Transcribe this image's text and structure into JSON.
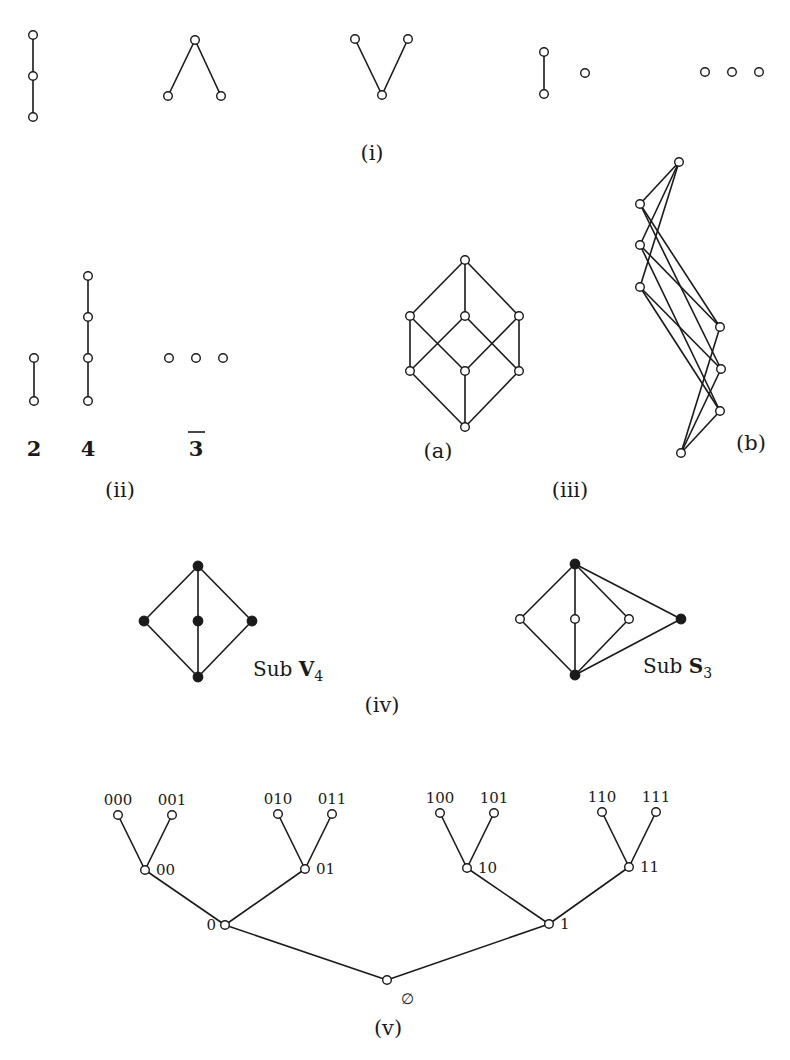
{
  "figure": {
    "panels": {
      "i": {
        "caption": "(i)",
        "posets": [
          {
            "name": "chain-3",
            "nodes": [
              [
                33,
                35
              ],
              [
                33,
                76
              ],
              [
                33,
                117
              ]
            ],
            "edges": [
              [
                0,
                1
              ],
              [
                1,
                2
              ]
            ]
          },
          {
            "name": "lambda",
            "nodes": [
              [
                195,
                40
              ],
              [
                168,
                96
              ],
              [
                221,
                96
              ]
            ],
            "edges": [
              [
                0,
                1
              ],
              [
                0,
                2
              ]
            ]
          },
          {
            "name": "vee",
            "nodes": [
              [
                355,
                39
              ],
              [
                408,
                39
              ],
              [
                382,
                95
              ]
            ],
            "edges": [
              [
                0,
                2
              ],
              [
                1,
                2
              ]
            ]
          },
          {
            "name": "chain-2-plus-point",
            "nodes": [
              [
                544,
                52
              ],
              [
                544,
                94
              ],
              [
                585,
                73
              ]
            ],
            "edges": [
              [
                0,
                1
              ]
            ]
          },
          {
            "name": "antichain-3",
            "nodes": [
              [
                705,
                72
              ],
              [
                732,
                72
              ],
              [
                759,
                72
              ]
            ],
            "edges": []
          }
        ]
      },
      "ii": {
        "caption": "(ii)",
        "posets": [
          {
            "name": "chain-2",
            "label": "2",
            "nodes": [
              [
                34,
                358
              ],
              [
                34,
                401
              ]
            ],
            "edges": [
              [
                0,
                1
              ]
            ]
          },
          {
            "name": "chain-4",
            "label": "4",
            "nodes": [
              [
                88,
                276
              ],
              [
                88,
                317
              ],
              [
                88,
                358
              ],
              [
                88,
                401
              ]
            ],
            "edges": [
              [
                0,
                1
              ],
              [
                1,
                2
              ],
              [
                2,
                3
              ]
            ]
          },
          {
            "name": "antichain-3",
            "label": "3",
            "label_overline": true,
            "nodes": [
              [
                169,
                358
              ],
              [
                196,
                358
              ],
              [
                223,
                358
              ]
            ],
            "edges": []
          }
        ]
      },
      "iii": {
        "caption": "(iii)",
        "sub_captions": [
          "(a)",
          "(b)"
        ],
        "posets": [
          {
            "name": "cube-a",
            "nodes": [
              [
                465,
                260
              ],
              [
                410,
                316
              ],
              [
                465,
                316
              ],
              [
                519,
                316
              ],
              [
                410,
                371
              ],
              [
                465,
                371
              ],
              [
                519,
                371
              ],
              [
                465,
                427
              ]
            ],
            "edges": [
              [
                0,
                1
              ],
              [
                0,
                2
              ],
              [
                0,
                3
              ],
              [
                1,
                4
              ],
              [
                1,
                5
              ],
              [
                2,
                4
              ],
              [
                2,
                6
              ],
              [
                3,
                5
              ],
              [
                3,
                6
              ],
              [
                4,
                7
              ],
              [
                5,
                7
              ],
              [
                6,
                7
              ]
            ]
          },
          {
            "name": "cube-b",
            "nodes": [
              [
                679,
                162
              ],
              [
                640,
                204
              ],
              [
                640,
                245
              ],
              [
                640,
                287
              ],
              [
                720,
                327
              ],
              [
                721,
                369
              ],
              [
                720,
                411
              ],
              [
                681,
                453
              ]
            ],
            "edges": [
              [
                0,
                1
              ],
              [
                0,
                2
              ],
              [
                0,
                3
              ],
              [
                1,
                4
              ],
              [
                1,
                5
              ],
              [
                2,
                4
              ],
              [
                2,
                6
              ],
              [
                3,
                5
              ],
              [
                3,
                6
              ],
              [
                4,
                7
              ],
              [
                5,
                7
              ],
              [
                6,
                7
              ]
            ]
          }
        ]
      },
      "iv": {
        "caption": "(iv)",
        "posets": [
          {
            "name": "sub-v4",
            "label_prefix": "Sub ",
            "label_bold": "V",
            "label_sub": "4",
            "nodes": [
              [
                198,
                566
              ],
              [
                144,
                621
              ],
              [
                198,
                621
              ],
              [
                252,
                621
              ],
              [
                198,
                677
              ]
            ],
            "filled": [
              true,
              true,
              true,
              true,
              true
            ],
            "edges": [
              [
                0,
                1
              ],
              [
                0,
                2
              ],
              [
                0,
                3
              ],
              [
                1,
                4
              ],
              [
                2,
                4
              ],
              [
                3,
                4
              ]
            ]
          },
          {
            "name": "sub-s3",
            "label_prefix": "Sub ",
            "label_bold": "S",
            "label_sub": "3",
            "nodes": [
              [
                575,
                564
              ],
              [
                520,
                619
              ],
              [
                575,
                619
              ],
              [
                629,
                619
              ],
              [
                681,
                619
              ],
              [
                575,
                675
              ]
            ],
            "filled": [
              true,
              false,
              false,
              false,
              true,
              true
            ],
            "edges": [
              [
                0,
                1
              ],
              [
                0,
                2
              ],
              [
                0,
                3
              ],
              [
                0,
                4
              ],
              [
                1,
                5
              ],
              [
                2,
                5
              ],
              [
                3,
                5
              ],
              [
                4,
                5
              ]
            ]
          }
        ]
      },
      "v": {
        "caption": "(v)",
        "tree": {
          "nodes": [
            {
              "id": "root",
              "label": "∅",
              "pos": [
                387,
                980
              ]
            },
            {
              "id": "0",
              "label": "0",
              "pos": [
                225,
                925
              ]
            },
            {
              "id": "1",
              "label": "1",
              "pos": [
                549,
                924
              ]
            },
            {
              "id": "00",
              "label": "00",
              "pos": [
                145,
                870
              ]
            },
            {
              "id": "01",
              "label": "01",
              "pos": [
                305,
                869
              ]
            },
            {
              "id": "10",
              "label": "10",
              "pos": [
                467,
                868
              ]
            },
            {
              "id": "11",
              "label": "11",
              "pos": [
                629,
                867
              ]
            },
            {
              "id": "000",
              "label": "000",
              "pos": [
                118,
                815
              ]
            },
            {
              "id": "001",
              "label": "001",
              "pos": [
                172,
                815
              ]
            },
            {
              "id": "010",
              "label": "010",
              "pos": [
                278,
                814
              ]
            },
            {
              "id": "011",
              "label": "011",
              "pos": [
                332,
                814
              ]
            },
            {
              "id": "100",
              "label": "100",
              "pos": [
                440,
                813
              ]
            },
            {
              "id": "101",
              "label": "101",
              "pos": [
                494,
                813
              ]
            },
            {
              "id": "110",
              "label": "110",
              "pos": [
                602,
                812
              ]
            },
            {
              "id": "111",
              "label": "111",
              "pos": [
                656,
                812
              ]
            }
          ],
          "edges": [
            [
              "root",
              "0"
            ],
            [
              "root",
              "1"
            ],
            [
              "0",
              "00"
            ],
            [
              "0",
              "01"
            ],
            [
              "1",
              "10"
            ],
            [
              "1",
              "11"
            ],
            [
              "00",
              "000"
            ],
            [
              "00",
              "001"
            ],
            [
              "01",
              "010"
            ],
            [
              "01",
              "011"
            ],
            [
              "10",
              "100"
            ],
            [
              "10",
              "101"
            ],
            [
              "11",
              "110"
            ],
            [
              "11",
              "111"
            ]
          ]
        }
      }
    }
  }
}
